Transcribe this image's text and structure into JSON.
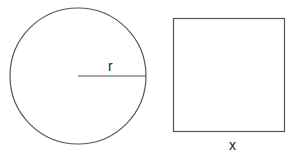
{
  "diagram": {
    "circle": {
      "center": [
        78,
        76
      ],
      "radius": 68,
      "radius_label": "r",
      "stroke": "#555555"
    },
    "square": {
      "x": 173,
      "y": 18,
      "width": 111,
      "height": 113,
      "side_label": "x",
      "stroke": "#555555"
    }
  }
}
